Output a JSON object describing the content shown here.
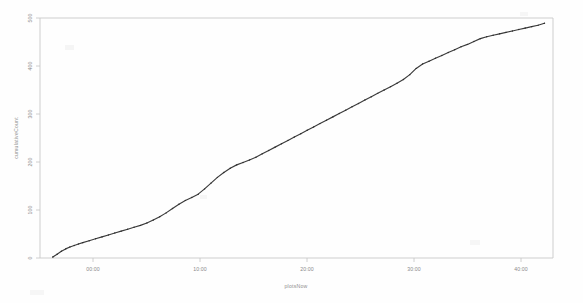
{
  "figure": {
    "title": "",
    "background_color": "#fefefe",
    "line_color": "#3b3b3b",
    "axis_color": "#c9c9c9",
    "label_color": "#8a8a8a"
  },
  "axes": {
    "x_title": "plotsNow",
    "y_title": "cumulativeCount",
    "x_tick_labels": [
      "00:00",
      "10:00",
      "20:00",
      "30:00",
      "40:00"
    ],
    "y_tick_labels": [
      "0",
      "100",
      "200",
      "300",
      "400",
      "500"
    ]
  },
  "chart_data": {
    "type": "line",
    "title": "",
    "xlabel": "plotsNow",
    "ylabel": "cumulativeCount",
    "xlim": [
      0,
      48
    ],
    "ylim": [
      0,
      500
    ],
    "xticks": [
      5,
      15,
      25,
      35,
      45
    ],
    "xticklabels": [
      "00:00",
      "10:00",
      "20:00",
      "30:00",
      "40:00"
    ],
    "yticks": [
      0,
      100,
      200,
      300,
      400,
      500
    ],
    "yticklabels": [
      "0",
      "100",
      "200",
      "300",
      "400",
      "500"
    ],
    "grid": false,
    "legend": null,
    "marker": "point",
    "series": [
      {
        "name": "cumulative",
        "x": [
          1.2,
          1.6,
          2.0,
          2.4,
          2.8,
          3.2,
          3.6,
          4.0,
          4.6,
          5.2,
          5.8,
          6.4,
          7.0,
          7.6,
          8.2,
          8.8,
          9.4,
          10.0,
          10.6,
          11.2,
          11.8,
          12.4,
          13.0,
          13.6,
          14.2,
          14.8,
          15.4,
          16.0,
          16.6,
          17.2,
          17.8,
          18.4,
          19.0,
          19.6,
          20.2,
          20.8,
          21.4,
          22.0,
          22.6,
          23.2,
          23.8,
          24.4,
          25.0,
          25.6,
          26.2,
          26.8,
          27.4,
          28.0,
          28.6,
          29.2,
          29.8,
          30.4,
          31.0,
          31.6,
          32.2,
          32.8,
          33.4,
          34.0,
          34.6,
          35.2,
          35.8,
          36.4,
          37.0,
          37.6,
          38.2,
          38.8,
          39.4,
          40.0,
          40.6,
          41.2,
          41.8,
          42.4,
          43.0,
          43.6,
          44.2,
          44.8,
          45.4,
          46.0,
          46.6,
          47.2
        ],
        "y": [
          2,
          8,
          14,
          19,
          23,
          26,
          29,
          32,
          36,
          40,
          44,
          48,
          52,
          56,
          60,
          64,
          68,
          73,
          79,
          86,
          94,
          103,
          112,
          120,
          126,
          133,
          144,
          156,
          168,
          178,
          187,
          194,
          199,
          204,
          210,
          217,
          224,
          231,
          238,
          245,
          252,
          259,
          266,
          273,
          280,
          287,
          294,
          301,
          308,
          315,
          322,
          329,
          336,
          343,
          350,
          357,
          364,
          372,
          382,
          395,
          404,
          410,
          416,
          422,
          428,
          434,
          440,
          445,
          451,
          457,
          461,
          464,
          467,
          470,
          473,
          476,
          479,
          482,
          485,
          489
        ]
      }
    ]
  }
}
